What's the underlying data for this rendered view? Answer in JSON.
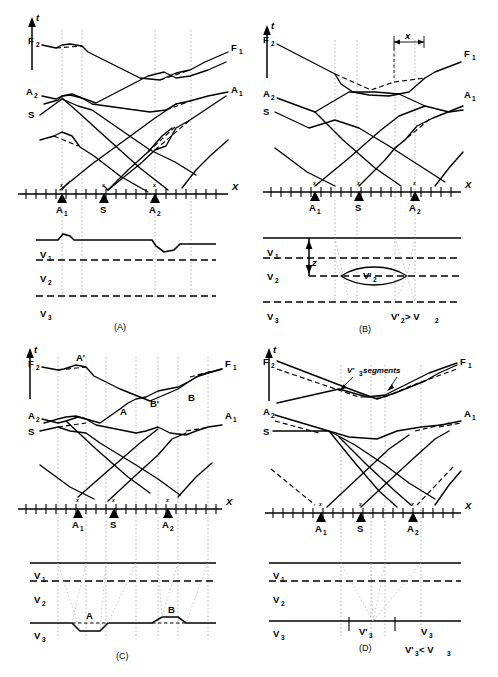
{
  "figure": {
    "panels": [
      "(A)",
      "(B)",
      "(C)",
      "(D)"
    ]
  },
  "axes": {
    "time_axis_label": "t",
    "distance_axis_label": "X"
  },
  "shotpoints": {
    "left": "A",
    "left_sub": "1",
    "center": "S",
    "right": "A",
    "right_sub": "2"
  },
  "curves": {
    "f2": "F",
    "f2_sub": "2",
    "f1": "F",
    "f1_sub": "1",
    "a2": "A",
    "a2_sub": "2",
    "a1": "A",
    "a1_sub": "1",
    "s": "S"
  },
  "velocities": {
    "v1": "V",
    "v1_sub": "1",
    "v2": "V",
    "v2_sub": "2",
    "v3": "V",
    "v3_sub": "3",
    "v2_prime": "V'",
    "v2_prime_sub": "2",
    "v3_prime": "V'",
    "v3_prime_sub": "3"
  },
  "panelA": {
    "caption": "(A)",
    "description": "Surface topography irregularities"
  },
  "panelB": {
    "caption": "(B)",
    "x_marker": "x",
    "z_marker": "z",
    "lens_label": "V'",
    "lens_label_sub": "2",
    "relation": "V'",
    "relation_sub": "2",
    "relation_op": " > V",
    "relation_op_sub": "2"
  },
  "panelC": {
    "caption": "(C)",
    "feature_a": "A",
    "feature_b": "B",
    "feature_a_prime": "A'",
    "feature_b_prime": "B'"
  },
  "panelD": {
    "caption": "(D)",
    "segments_note": " segments",
    "segments_note_prefix": "V'",
    "segments_note_sub": "3",
    "zone_prime": "V'",
    "zone_prime_sub": "3",
    "zone_normal": "V",
    "zone_normal_sub": "3",
    "relation": "V'",
    "relation_sub": "3",
    "relation_op": " < V",
    "relation_op_sub": "3"
  },
  "colors": {
    "ink": "#000000",
    "projection": "#9a9a9a",
    "background": "#ffffff"
  }
}
